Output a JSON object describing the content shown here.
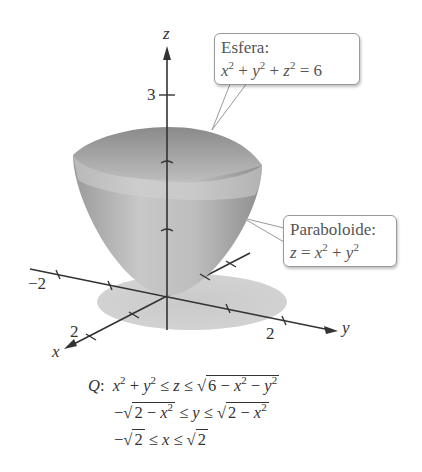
{
  "figure": {
    "axes": {
      "z_label": "z",
      "x_label": "x",
      "y_label": "y",
      "z_tick_label": "3",
      "y_neg_tick_label": "−2",
      "x_tick_label": "2",
      "y_tick_label": "2"
    },
    "callouts": {
      "sphere": {
        "title": "Esfera:",
        "equation": "x² + y² + z² = 6"
      },
      "paraboloid": {
        "title": "Paraboloide:",
        "equation": "z = x² + y²"
      }
    },
    "region": {
      "name": "Q:",
      "line1": "x² + y² ≤ z ≤ √(6 − x² − y²)",
      "line2": "−√(2 − x²) ≤ y ≤ √(2 − x²)",
      "line3": "−√2 ≤ x ≤ √2"
    },
    "colors": {
      "surface": "#a8a8a8",
      "surface_light": "#d0d0d0",
      "shadow": "#c8c8c8",
      "axis": "#333333",
      "callout_border": "#9a9a9a"
    }
  }
}
